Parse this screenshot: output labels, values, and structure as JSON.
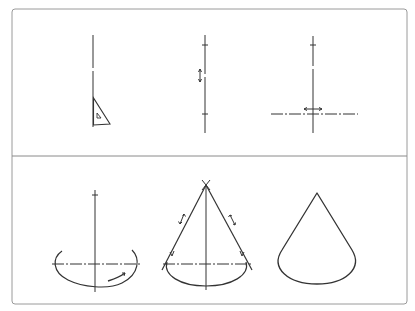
{
  "diagram": {
    "title": "",
    "colors": {
      "line": "#333333",
      "frame": "#9a9a9a",
      "background": "#ffffff"
    },
    "panels": [
      {
        "id": "top",
        "steps": [
          {
            "label": "step-1",
            "content": "vertical axis drawn with set square (triangle)"
          },
          {
            "label": "step-2",
            "content": "vertical axis with apex and base marks, vertical double arrow"
          },
          {
            "label": "step-3",
            "content": "horizontal base line crossing axis, horizontal double arrow"
          }
        ]
      },
      {
        "id": "bottom",
        "steps": [
          {
            "label": "step-4",
            "content": "elliptical base arc drawn around axis crossing"
          },
          {
            "label": "step-5",
            "content": "tangent lines from apex to ellipse"
          },
          {
            "label": "step-6",
            "content": "finished cone outline"
          }
        ]
      }
    ]
  }
}
